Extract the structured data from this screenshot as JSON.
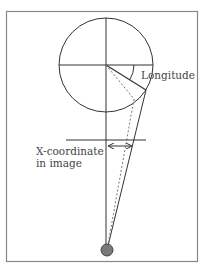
{
  "diagram": {
    "type": "geometric projection diagram",
    "labels": {
      "longitude": "Longitude",
      "x_coordinate_line1": "X-coordinate",
      "x_coordinate_line2": "in image"
    },
    "colors": {
      "frame": "#888888",
      "lines": "#333333",
      "dashed": "#777777",
      "eye_fill": "#7a7a7a",
      "eye_stroke": "#444444",
      "text": "#444444",
      "background": "#ffffff"
    },
    "elements": [
      "globe-circle",
      "horizontal-axis",
      "vertical-axis",
      "longitude-radius",
      "longitude-angle-arc",
      "projection-ray-solid",
      "projection-ray-dashed",
      "image-plane-line",
      "x-coordinate-double-arrow",
      "eye-viewpoint"
    ]
  }
}
